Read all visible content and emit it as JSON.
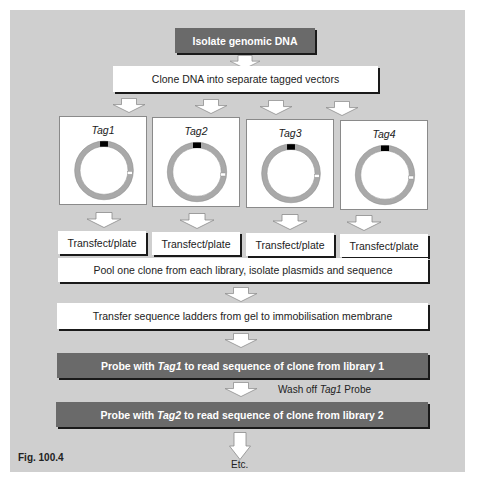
{
  "figure_label": "Fig. 100.4",
  "steps": {
    "isolate": "Isolate genomic DNA",
    "clone": "Clone DNA into separate tagged vectors",
    "tags": [
      {
        "label": "Tag1"
      },
      {
        "label": "Tag2"
      },
      {
        "label": "Tag3"
      },
      {
        "label": "Tag4"
      }
    ],
    "transfect": [
      "Transfect/plate",
      "Transfect/plate",
      "Transfect/plate",
      "Transfect/plate"
    ],
    "pool": "Pool one clone from each library, isolate plasmids and sequence",
    "transfer": "Transfer sequence ladders from gel to immobilisation membrane",
    "probe1": {
      "prefix": "Probe with ",
      "tag": "Tag1",
      "suffix": " to read sequence of clone from library 1"
    },
    "wash": {
      "prefix": "Wash off ",
      "tag": "Tag1",
      "suffix": " Probe"
    },
    "probe2": {
      "prefix": "Probe with ",
      "tag": "Tag2",
      "suffix": " to read sequence of clone from library 2"
    },
    "etc": "Etc."
  },
  "colors": {
    "panel_bg": "#cfcfcf",
    "dark_box": "#6a6a6a",
    "plasmid_ring": "#a9a9a9",
    "tag_marker": "#000000"
  }
}
